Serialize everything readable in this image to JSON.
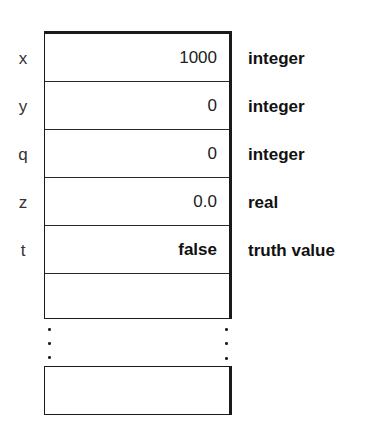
{
  "memory": {
    "rows": [
      {
        "name": "x",
        "value": "1000",
        "type": "integer",
        "value_bold": false
      },
      {
        "name": "y",
        "value": "0",
        "type": "integer",
        "value_bold": false
      },
      {
        "name": "q",
        "value": "0",
        "type": "integer",
        "value_bold": false
      },
      {
        "name": "z",
        "value": "0.0",
        "type": "real",
        "value_bold": false
      },
      {
        "name": "t",
        "value": "false",
        "type": "truth value",
        "value_bold": true
      },
      {
        "name": "",
        "value": "",
        "type": "",
        "value_bold": false
      }
    ],
    "ellipsis": "⋮",
    "last_cell": {
      "name": "",
      "value": "",
      "type": ""
    }
  },
  "colors": {
    "border": "#1a1a1a",
    "text": "#111111",
    "background": "#ffffff"
  }
}
